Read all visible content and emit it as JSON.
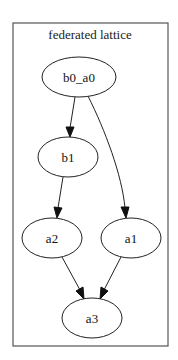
{
  "graph": {
    "cluster_label": "federated lattice",
    "nodes": [
      {
        "id": "b0_a0",
        "label": "b0_a0"
      },
      {
        "id": "b1",
        "label": "b1"
      },
      {
        "id": "a2",
        "label": "a2"
      },
      {
        "id": "a1",
        "label": "a1"
      },
      {
        "id": "a3",
        "label": "a3"
      }
    ],
    "edges": [
      {
        "from": "b0_a0",
        "to": "b1"
      },
      {
        "from": "b0_a0",
        "to": "a1"
      },
      {
        "from": "b1",
        "to": "a2"
      },
      {
        "from": "a2",
        "to": "a3"
      },
      {
        "from": "a1",
        "to": "a3"
      }
    ]
  }
}
